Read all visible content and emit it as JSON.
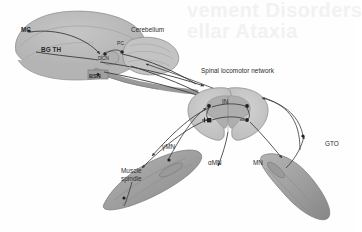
{
  "figure": {
    "type": "neuroanatomy-schematic",
    "title_watermark_line1": "vement Disorders",
    "title_watermark_line2": "ellar Ataxia",
    "palette": {
      "background": "#fefefe",
      "brain_fill": "#b9b9b9",
      "brain_stroke": "#8f8f8f",
      "cerebellum_fill": "#c3c3c3",
      "cord_fill": "#c9c9c9",
      "gray_matter": "#aeaeae",
      "muscle_fill": "#a9a9a9",
      "muscle_dark": "#8b8b8b",
      "line": "#3a3a3a",
      "node": "#1f1f1f",
      "watermark": "#f2f2f2",
      "text": "#2b2b2b"
    }
  },
  "labels": {
    "motor_cortex": "MC",
    "basal_ganglia_thalamus": "BG TH",
    "cerebellum": "Cerebellum",
    "purkinje_cell": "PC",
    "deep_cerebellar_nuclei": "DCN",
    "brainstem_nuclei": "BSN",
    "spinal_network": "Spinal locomotor network",
    "interneuron": "IN",
    "gamma_motor_neuron": "γMN",
    "alpha_motor_neuron": "αMN",
    "motor_neuron": "MN",
    "muscle_spindle_line1": "Muscle",
    "muscle_spindle_line2": "spindle",
    "golgi_tendon_organ": "GTO",
    "excitatory_sign": "+",
    "inhibitory_sign": "−"
  }
}
